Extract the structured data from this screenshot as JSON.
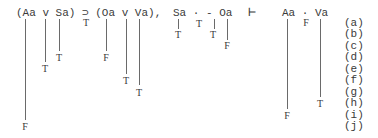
{
  "premises": {
    "formula1": "(Aa v Sa) ⊃ (Oa v Va),",
    "formula2": "Sa · - Oa"
  },
  "turnstile": "⊢",
  "conclusion": "Aa · Va",
  "marks": {
    "f1_horseshoe": "T",
    "f1_Aa": "F",
    "f1_or1": "T",
    "f1_Sa": "T",
    "f1_Oa": "F",
    "f1_or2": "T",
    "f1_Va": "T",
    "f2_Sa": "T",
    "f2_dot": "T",
    "f2_neg": "T",
    "f2_Oa": "F",
    "c_Aa": "F",
    "c_dot": "F",
    "c_Va": "T"
  },
  "row_labels": [
    "(a)",
    "(b)",
    "(c)",
    "(d)",
    "(e)",
    "(f)",
    "(g)",
    "(h)",
    "(i)",
    "(j)"
  ]
}
